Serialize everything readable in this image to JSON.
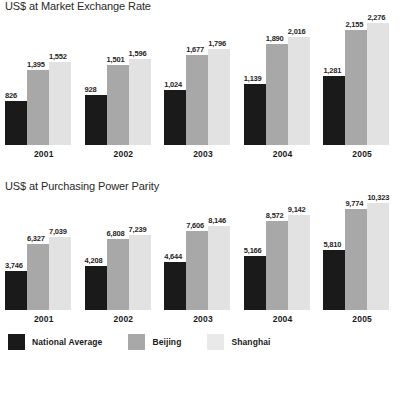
{
  "chart_data": [
    {
      "type": "bar",
      "title": "US$ at Market Exchange Rate",
      "xlabel": "",
      "ylabel": "",
      "ylim": [
        0,
        2276
      ],
      "grid": false,
      "legend_position": "bottom-shared",
      "categories": [
        "2001",
        "2002",
        "2003",
        "2004",
        "2005"
      ],
      "series": [
        {
          "name": "National Average",
          "color": "#1a1a1a",
          "values": [
            826,
            928,
            1024,
            1139,
            1281
          ],
          "labels": [
            "826",
            "928",
            "1,024",
            "1,139",
            "1,281"
          ]
        },
        {
          "name": "Beijing",
          "color": "#a8a8a8",
          "values": [
            1395,
            1501,
            1677,
            1890,
            2155
          ],
          "labels": [
            "1,395",
            "1,501",
            "1,677",
            "1,890",
            "2,155"
          ]
        },
        {
          "name": "Shanghai",
          "color": "#e2e2e2",
          "values": [
            1552,
            1596,
            1796,
            2016,
            2276
          ],
          "labels": [
            "1,552",
            "1,596",
            "1,796",
            "2,016",
            "2,276"
          ]
        }
      ]
    },
    {
      "type": "bar",
      "title": "US$ at Purchasing Power Parity",
      "xlabel": "",
      "ylabel": "",
      "ylim": [
        0,
        10323
      ],
      "grid": false,
      "legend_position": "bottom-shared",
      "categories": [
        "2001",
        "2002",
        "2003",
        "2004",
        "2005"
      ],
      "series": [
        {
          "name": "National Average",
          "color": "#1a1a1a",
          "values": [
            3746,
            4208,
            4644,
            5166,
            5810
          ],
          "labels": [
            "3,746",
            "4,208",
            "4,644",
            "5,166",
            "5,810"
          ]
        },
        {
          "name": "Beijing",
          "color": "#a8a8a8",
          "values": [
            6327,
            6808,
            7606,
            8572,
            9774
          ],
          "labels": [
            "6,327",
            "6,808",
            "7,606",
            "8,572",
            "9,774"
          ]
        },
        {
          "name": "Shanghai",
          "color": "#e2e2e2",
          "values": [
            7039,
            7239,
            8146,
            9142,
            10323
          ],
          "labels": [
            "7,039",
            "7,239",
            "8,146",
            "9,142",
            "10,323"
          ]
        }
      ]
    }
  ],
  "legend": {
    "items": [
      {
        "label": "National Average",
        "color": "#1a1a1a"
      },
      {
        "label": "Beijing",
        "color": "#a8a8a8"
      },
      {
        "label": "Shanghai",
        "color": "#e9e9e9"
      }
    ]
  }
}
